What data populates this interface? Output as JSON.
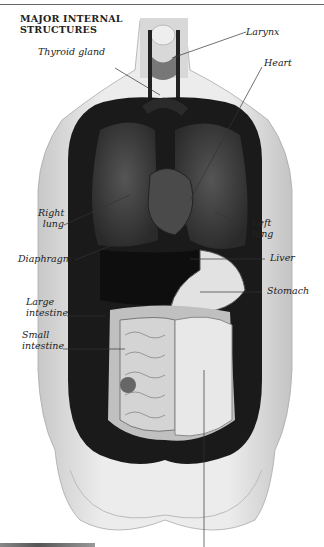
{
  "header": {
    "title_line1": "MAJOR INTERNAL",
    "title_line2": "STRUCTURES"
  },
  "labels": {
    "larynx": "Larynx",
    "thyroid_gland": "Thyroid gland",
    "heart": "Heart",
    "right_lung_1": "Right",
    "right_lung_2": "lung",
    "left_lung_1": "Left",
    "left_lung_2": "lung",
    "diaphragm": "Diaphragm",
    "liver": "Liver",
    "stomach": "Stomach",
    "large_intestine_1": "Large",
    "large_intestine_2": "intestine",
    "small_intestine_1": "Small",
    "small_intestine_2": "intestine"
  },
  "colors": {
    "text": "#222222",
    "leader_line": "#333333",
    "torso": "#dcdcdc",
    "lung": "#3a3a3a"
  }
}
